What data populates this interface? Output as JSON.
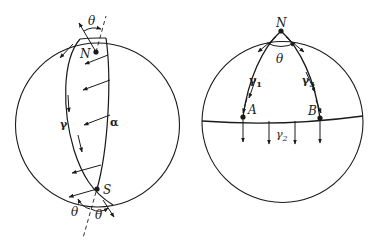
{
  "figure": {
    "left_sphere": {
      "labels": {
        "north": "N",
        "south": "S",
        "curve_gamma": "γ",
        "curve_alpha": "α",
        "angle_top": "θ",
        "angle_bottom_left": "θ",
        "angle_bottom_right": "θ"
      }
    },
    "right_sphere": {
      "labels": {
        "north": "N",
        "point_a": "A",
        "point_b": "B",
        "angle": "θ",
        "gamma1": "γ",
        "gamma1_sub": "1",
        "gamma2": "γ",
        "gamma2_sub": "2",
        "gamma3": "γ",
        "gamma3_sub": "3"
      }
    },
    "colors": {
      "stroke": "#1a1a1a",
      "background": "#ffffff"
    }
  }
}
